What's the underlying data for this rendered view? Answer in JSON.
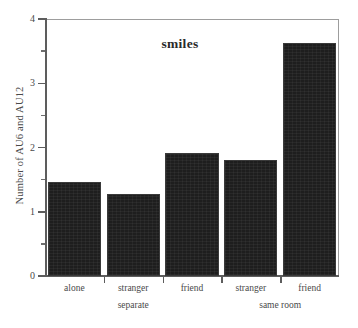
{
  "chart_data": {
    "type": "bar",
    "title": "smiles",
    "xlabel": "",
    "ylabel": "Number of AU6 and AU12",
    "categories": [
      "alone",
      "stranger",
      "friend",
      "stranger",
      "friend"
    ],
    "values": [
      1.47,
      1.27,
      1.91,
      1.8,
      3.63
    ],
    "groups": [
      {
        "label": "separate",
        "categories": [
          "alone",
          "stranger",
          "friend"
        ]
      },
      {
        "label": "same room",
        "categories": [
          "stranger",
          "friend"
        ]
      }
    ],
    "ylim": [
      0,
      4
    ],
    "ytick_labels": [
      "0",
      "1",
      "2",
      "3",
      "4"
    ],
    "ytick_values": [
      0,
      1,
      2,
      3,
      4
    ],
    "yminor_tick_values": [
      0.5,
      1.5,
      2.5,
      3.5
    ],
    "grid": false,
    "legend": null,
    "bar_color": "#1e1e1e",
    "axis_color": "#5d5d5d",
    "frame_color": "#9d9d9d",
    "background": "#ffffff"
  },
  "axis": {
    "yticks": [
      {
        "label": "4",
        "value": 4
      },
      {
        "label": "3",
        "value": 3
      },
      {
        "label": "2",
        "value": 2
      },
      {
        "label": "1",
        "value": 1
      },
      {
        "label": "0",
        "value": 0
      }
    ]
  }
}
